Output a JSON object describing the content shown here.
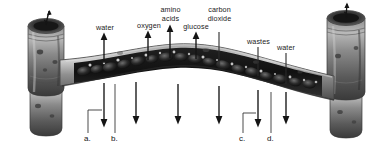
{
  "figure": {
    "style": "grayscale biological illustration",
    "background_color": "#ffffff",
    "vessel_color": "#6e6e6e",
    "vessel_dark_color": "#2b2b2b",
    "arrow_color": "#141414",
    "leader_color": "#2a2a2a",
    "text_color": "#1a1a1a"
  },
  "labels": {
    "water_left": "water",
    "oxygen": "oxygen",
    "amino_acids_line1": "amino",
    "amino_acids_line2": "acids",
    "glucose": "glucose",
    "carbon_dioxide_line1": "carbon",
    "carbon_dioxide_line2": "dioxide",
    "wastes": "wastes",
    "water_right": "water"
  },
  "keys": {
    "a": "a.",
    "b": "b.",
    "c": "c.",
    "d": "d."
  },
  "arrows": {
    "up": [
      {
        "name": "water-up-arrow",
        "x": 104,
        "y_tip": 34,
        "y_tail": 63
      },
      {
        "name": "oxygen-up-arrow",
        "x": 148,
        "y_tip": 32,
        "y_tail": 60
      },
      {
        "name": "amino-acids-up-arrow",
        "x": 170,
        "y_tip": 26,
        "y_tail": 58
      },
      {
        "name": "glucose-up-arrow",
        "x": 196,
        "y_tip": 33,
        "y_tail": 59
      }
    ],
    "down": [
      {
        "name": "water-down-arrow-a",
        "x": 104,
        "y_tail": 83,
        "y_tip": 127
      },
      {
        "name": "oxygen-down-arrow",
        "x": 136,
        "y_tail": 84,
        "y_tip": 124
      },
      {
        "name": "amino-acids-down-arrow",
        "x": 178,
        "y_tail": 86,
        "y_tip": 124
      },
      {
        "name": "carbon-dioxide-down-arrow",
        "x": 219,
        "y_tail": 88,
        "y_tip": 124
      },
      {
        "name": "wastes-down-arrow-c",
        "x": 258,
        "y_tail": 90,
        "y_tip": 127
      },
      {
        "name": "water-down-arrow-d",
        "x": 286,
        "y_tail": 92,
        "y_tip": 124
      }
    ]
  }
}
